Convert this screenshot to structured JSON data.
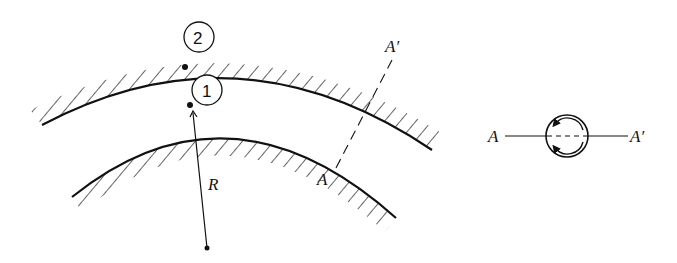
{
  "figure": {
    "type": "curved channel cross-section diagram",
    "points": [
      {
        "id": "point-2",
        "label": "2",
        "location": "outer wall"
      },
      {
        "id": "point-1",
        "label": "1",
        "location": "inner wall"
      }
    ],
    "radius_label": "R",
    "section_labels": {
      "start": "A",
      "end": "A′"
    },
    "section_view": {
      "left_label": "A",
      "right_label": "A′",
      "description": "secondary flow circulation"
    }
  },
  "colors": {
    "ink": "#111111",
    "background": "#ffffff"
  }
}
